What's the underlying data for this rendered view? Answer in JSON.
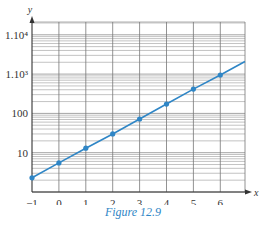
{
  "caption": "Figure 12.9",
  "colors": {
    "line": "#2f86c6",
    "grid": "#9a9a9a",
    "axis": "#333333",
    "caption": "#2f86c6"
  },
  "chart_data": {
    "type": "line",
    "title": "",
    "caption": "Figure 12.9",
    "xlabel": "x",
    "ylabel": "y",
    "yscale": "log",
    "xlim": [
      -1,
      7
    ],
    "ylim": [
      1,
      20000
    ],
    "grid": true,
    "x_ticks": [
      -1,
      0,
      1,
      2,
      3,
      4,
      5,
      6
    ],
    "y_ticks": [
      {
        "value": 10,
        "label": "10"
      },
      {
        "value": 100,
        "label": "100"
      },
      {
        "value": 1000,
        "label": "1.10³"
      },
      {
        "value": 10000,
        "label": "1.10⁴"
      }
    ],
    "series": [
      {
        "name": "data",
        "x": [
          -1,
          0,
          1,
          2,
          3,
          4,
          5,
          6
        ],
        "values": [
          2.3,
          5.5,
          13,
          30,
          72,
          173,
          415,
          950
        ]
      }
    ],
    "fit_line_extends_to_x": 7
  }
}
